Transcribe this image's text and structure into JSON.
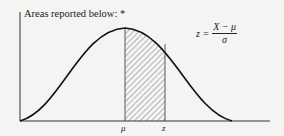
{
  "title": "Areas reported below: *",
  "formula": {
    "lhs": "z =",
    "numerator": "X − μ",
    "denominator": "σ"
  },
  "labels": {
    "mu": "μ",
    "z": "z"
  },
  "colors": {
    "curve": "#111111",
    "axis": "#333333",
    "hatch": "#555555",
    "background": "#f4f4f2"
  }
}
